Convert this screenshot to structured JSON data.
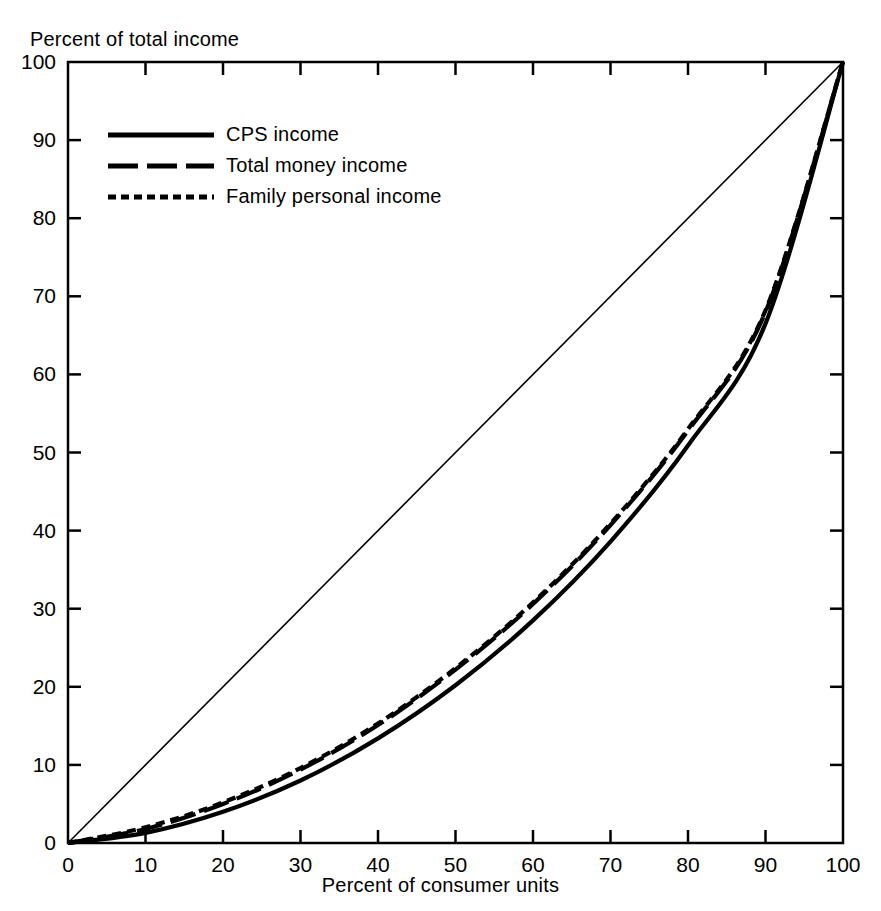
{
  "chart_data": {
    "type": "line",
    "title": "",
    "xlabel": "Percent of consumer units",
    "ylabel": "Percent of total income",
    "xlim": [
      0,
      100
    ],
    "ylim": [
      0,
      100
    ],
    "grid": false,
    "legend_position": "upper-left",
    "xticks": [
      0,
      10,
      20,
      30,
      40,
      50,
      60,
      70,
      80,
      90,
      100
    ],
    "yticks": [
      0,
      10,
      20,
      30,
      40,
      50,
      60,
      70,
      80,
      90,
      100
    ],
    "xtick_labels": [
      "0",
      "10",
      "20",
      "30",
      "40",
      "50",
      "60",
      "70",
      "80",
      "90",
      "100"
    ],
    "ytick_labels": [
      "0",
      "10",
      "20",
      "30",
      "40",
      "50",
      "60",
      "70",
      "80",
      "90",
      "100"
    ],
    "x": [
      0,
      10,
      20,
      30,
      40,
      50,
      60,
      70,
      80,
      90,
      100
    ],
    "series": [
      {
        "name": "CPS income",
        "style": "solid",
        "values": [
          0,
          1.3,
          4.0,
          8.0,
          13.4,
          20.2,
          28.5,
          38.6,
          50.9,
          66.5,
          100
        ]
      },
      {
        "name": "Total money income",
        "style": "long-dash",
        "values": [
          0,
          1.8,
          5.0,
          9.4,
          15.1,
          22.2,
          30.6,
          40.7,
          52.8,
          68.0,
          100
        ]
      },
      {
        "name": "Family personal income",
        "style": "short-dash",
        "values": [
          0,
          2.0,
          5.2,
          9.6,
          15.3,
          22.4,
          30.8,
          40.9,
          53.0,
          68.2,
          100
        ]
      }
    ],
    "reference_line": {
      "name": "line of equality",
      "x": [
        0,
        100
      ],
      "values": [
        0,
        100
      ]
    }
  },
  "legend": {
    "items": [
      {
        "label": "CPS income",
        "style": "solid"
      },
      {
        "label": "Total money income",
        "style": "long-dash"
      },
      {
        "label": "Family personal income",
        "style": "short-dash"
      }
    ]
  }
}
